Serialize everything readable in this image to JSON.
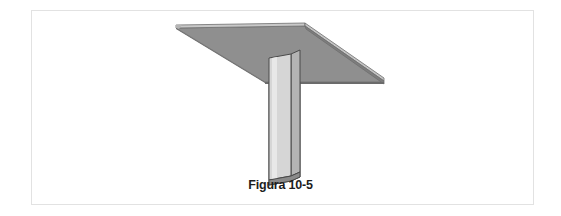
{
  "figure": {
    "caption": "Figura 10-5",
    "alt_description": "Perspectiva isometrica de una losa plana soportada por una columna rectangular central",
    "frame": {
      "border_color": "#9a9a9a",
      "background": "#ffffff"
    },
    "colors": {
      "slab_underside": "#8f8f8f",
      "slab_top_strip": "#c8c8c8",
      "slab_edge_light": "#bdbdbd",
      "slab_edge_dark": "#777777",
      "column_front": "#d6d6d6",
      "column_side": "#b4b4b4",
      "column_bottom": "#8a8a8a",
      "outline": "#4a4a4a",
      "caption_text": "#1d1d1d",
      "page_background": "#ffffff"
    },
    "parts": [
      {
        "id": "slab",
        "label": "losa"
      },
      {
        "id": "slab-top-edge",
        "label": "borde superior de la losa"
      },
      {
        "id": "slab-right-edge",
        "label": "borde derecho de la losa"
      },
      {
        "id": "column",
        "label": "columna"
      },
      {
        "id": "column-side",
        "label": "cara lateral de la columna"
      },
      {
        "id": "column-base",
        "label": "base de la columna"
      }
    ]
  }
}
